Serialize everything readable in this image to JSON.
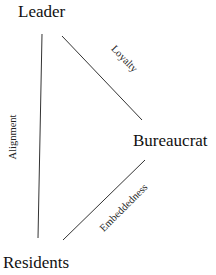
{
  "nodes": {
    "leader": "Leader",
    "bureaucrat": "Bureaucrat",
    "residents": "Residents"
  },
  "edges": {
    "leader_bureaucrat": "Loyalty",
    "leader_residents": "Alignment",
    "bureaucrat_residents": "Embeddedness"
  },
  "colors": {
    "line": "#222222",
    "text": "#111111"
  }
}
